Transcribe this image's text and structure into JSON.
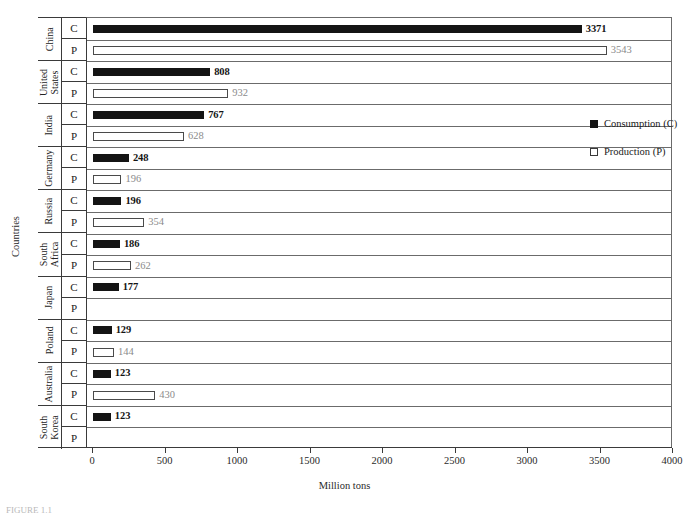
{
  "figure": {
    "y_axis_title": "Countries",
    "x_axis_title": "Million tons",
    "caption": "FIGURE 1.1"
  },
  "legend": {
    "position": "inside-right",
    "items": [
      {
        "label": "Consumption (C)",
        "marker": "filled-square",
        "color": "#141414"
      },
      {
        "label": "Production (P)",
        "marker": "hollow-square",
        "color": "#ffffff"
      }
    ]
  },
  "axis": {
    "ticks": [
      "0",
      "500",
      "1000",
      "1500",
      "2000",
      "2500",
      "3000",
      "3500",
      "4000"
    ],
    "tick_values": [
      0,
      500,
      1000,
      1500,
      2000,
      2500,
      3000,
      3500,
      4000
    ],
    "min": 0,
    "max": 4000
  },
  "row_labels": {
    "consumption": "C",
    "production": "P"
  },
  "chart_data": {
    "type": "bar",
    "orientation": "horizontal",
    "title": "",
    "xlabel": "Million tons",
    "ylabel": "Countries",
    "xlim": [
      0,
      4000
    ],
    "grid": false,
    "legend_position": "inside-right",
    "categories": [
      "China",
      "United States",
      "India",
      "Germany",
      "Russia",
      "South Africa",
      "Japan",
      "Poland",
      "Australia",
      "South Korea"
    ],
    "series": [
      {
        "name": "Consumption (C)",
        "values": [
          3371,
          808,
          767,
          248,
          196,
          186,
          177,
          129,
          123,
          123
        ]
      },
      {
        "name": "Production (P)",
        "values": [
          3543,
          932,
          628,
          196,
          354,
          262,
          null,
          144,
          430,
          null
        ]
      }
    ],
    "rows": [
      {
        "country": "China",
        "country_lines": [
          "China"
        ],
        "c": 3371,
        "c_label": "3371",
        "p": 3543,
        "p_label": "3543"
      },
      {
        "country": "United States",
        "country_lines": [
          "United",
          "States"
        ],
        "c": 808,
        "c_label": "808",
        "p": 932,
        "p_label": "932"
      },
      {
        "country": "India",
        "country_lines": [
          "India"
        ],
        "c": 767,
        "c_label": "767",
        "p": 628,
        "p_label": "628"
      },
      {
        "country": "Germany",
        "country_lines": [
          "Germany"
        ],
        "c": 248,
        "c_label": "248",
        "p": 196,
        "p_label": "196"
      },
      {
        "country": "Russia",
        "country_lines": [
          "Russia"
        ],
        "c": 196,
        "c_label": "196",
        "p": 354,
        "p_label": "354"
      },
      {
        "country": "South Africa",
        "country_lines": [
          "South",
          "Africa"
        ],
        "c": 186,
        "c_label": "186",
        "p": 262,
        "p_label": "262"
      },
      {
        "country": "Japan",
        "country_lines": [
          "Japan"
        ],
        "c": 177,
        "c_label": "177",
        "p": null,
        "p_label": ""
      },
      {
        "country": "Poland",
        "country_lines": [
          "Poland"
        ],
        "c": 129,
        "c_label": "129",
        "p": 144,
        "p_label": "144"
      },
      {
        "country": "Australia",
        "country_lines": [
          "Australia"
        ],
        "c": 123,
        "c_label": "123",
        "p": 430,
        "p_label": "430"
      },
      {
        "country": "South Korea",
        "country_lines": [
          "South",
          "Korea"
        ],
        "c": 123,
        "c_label": "123",
        "p": null,
        "p_label": ""
      }
    ]
  }
}
